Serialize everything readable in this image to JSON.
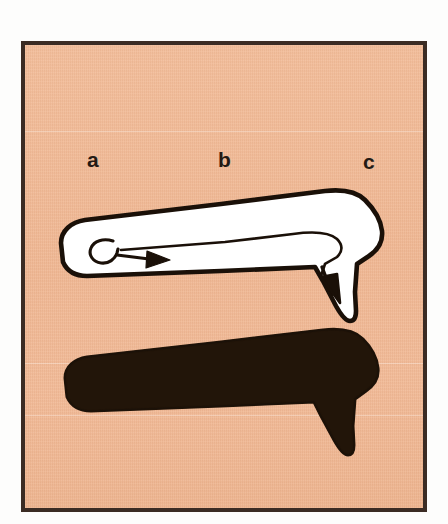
{
  "figure": {
    "kind": "scanned-plate-diagram",
    "background_color": "#f0b894",
    "frame_color": "#3b2c24",
    "page_color": "#fdfdfc",
    "outline_color": "#1a1008",
    "fill_color": "#ffffff",
    "silhouette_color": "#221509"
  },
  "labels": {
    "a": "a",
    "b": "b",
    "c": "c"
  },
  "shapes": {
    "outlined_arrow": {
      "name": "outlined-arrow",
      "description": "Elongated outlined arrow body running left to right, bending downward at the right end, with an interior directional arrow that begins as a curled hook at the left and terminates in a solid arrowhead pointing down-right.",
      "fill": "#ffffff",
      "stroke": "#1a1008"
    },
    "solid_arrow": {
      "name": "solid-silhouette-arrow",
      "description": "Solid black silhouette of the same arrow form, filled entirely.",
      "fill": "#221509"
    },
    "inner_hook": {
      "name": "inner-hook-arrow",
      "description": "Thin interior arrow: curled tail at a, straight shaft through b, arrowhead turning down at c."
    }
  }
}
